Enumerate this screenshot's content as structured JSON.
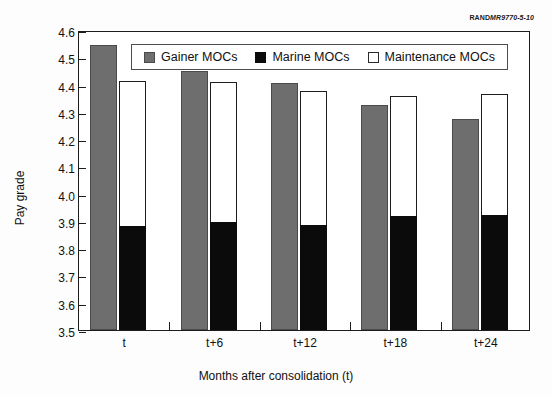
{
  "source_credit": {
    "prefix": "RAND",
    "italic": "MR9770-5-10"
  },
  "legend": {
    "items": [
      {
        "label": "Gainer MOCs",
        "swatch": "gray-square-icon"
      },
      {
        "label": "Marine MOCs",
        "swatch": "black-square-icon"
      },
      {
        "label": "Maintenance MOCs",
        "swatch": "white-square-icon"
      }
    ]
  },
  "chart_data": {
    "type": "bar",
    "title": "",
    "xlabel": "Months after consolidation (t)",
    "ylabel": "Pay grade",
    "categories": [
      "t",
      "t+6",
      "t+12",
      "t+18",
      "t+24"
    ],
    "series": [
      {
        "name": "Gainer MOCs",
        "color": "#6e6e6e",
        "values": [
          4.545,
          4.45,
          4.405,
          4.325,
          4.275
        ]
      },
      {
        "name": "Marine MOCs",
        "color": "#0b0b0b",
        "values": [
          3.883,
          3.897,
          3.885,
          3.917,
          3.92
        ]
      },
      {
        "name": "Maintenance MOCs",
        "color": "#ffffff",
        "values": [
          4.412,
          4.41,
          4.375,
          4.358,
          4.365
        ]
      }
    ],
    "ylim": [
      3.5,
      4.6
    ],
    "yticks": [
      "4.6",
      "4.5",
      "4.4",
      "4.3",
      "4.2",
      "4.1",
      "4.0",
      "3.9",
      "3.8",
      "3.7",
      "3.6",
      "3.5"
    ],
    "grid": false,
    "legend_position": "top-center"
  }
}
